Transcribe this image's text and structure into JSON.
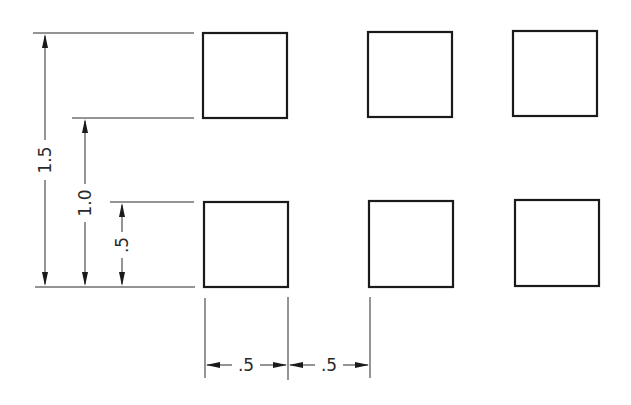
{
  "drawing": {
    "title": "Square pattern dimensioned drawing",
    "squares": [
      {
        "row": "top",
        "col": 1,
        "x": 203,
        "y": 33,
        "w": 84,
        "h": 85
      },
      {
        "row": "top",
        "col": 2,
        "x": 368,
        "y": 32,
        "w": 84,
        "h": 85
      },
      {
        "row": "top",
        "col": 3,
        "x": 513,
        "y": 31,
        "w": 84,
        "h": 85
      },
      {
        "row": "bottom",
        "col": 1,
        "x": 204,
        "y": 202,
        "w": 84,
        "h": 85
      },
      {
        "row": "bottom",
        "col": 2,
        "x": 369,
        "y": 201,
        "w": 84,
        "h": 86
      },
      {
        "row": "bottom",
        "col": 3,
        "x": 515,
        "y": 200,
        "w": 84,
        "h": 86
      }
    ],
    "vertical_dimensions": [
      {
        "label": "1.5",
        "x": 45,
        "from_y": 287,
        "to_y": 33
      },
      {
        "label": "1.0",
        "x": 85,
        "from_y": 287,
        "to_y": 118
      },
      {
        "label": ".5",
        "x": 122,
        "from_y": 287,
        "to_y": 202
      }
    ],
    "horizontal_dimensions": [
      {
        "label": ".5",
        "y": 365,
        "from_x": 205,
        "to_x": 288
      },
      {
        "label": ".5",
        "y": 365,
        "from_x": 288,
        "to_x": 370
      }
    ],
    "line_color": "#1a1a1a",
    "background": "#ffffff"
  }
}
